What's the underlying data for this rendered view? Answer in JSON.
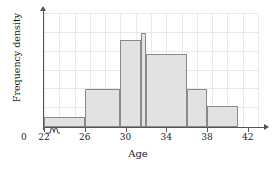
{
  "chart_data": {
    "type": "bar",
    "title": "",
    "subtitle": "",
    "xlabel": "Age",
    "ylabel": "Frequency density",
    "xlim": [
      22,
      43
    ],
    "ylim": [
      0,
      6
    ],
    "grid": true,
    "legend": null,
    "axis_break_x": true,
    "x_tick_labels": [
      "22",
      "26",
      "30",
      "34",
      "38",
      "42"
    ],
    "x_tick_values": [
      22,
      26,
      30,
      34,
      38,
      42
    ],
    "origin_label": "0",
    "y_tick_labels": [],
    "bins": [
      {
        "start": 22,
        "end": 26,
        "density": 0.55
      },
      {
        "start": 26,
        "end": 29.5,
        "density": 2.0
      },
      {
        "start": 29.5,
        "end": 31.5,
        "density": 4.6
      },
      {
        "start": 31.5,
        "end": 32,
        "density": 5.0
      },
      {
        "start": 32,
        "end": 36,
        "density": 3.9
      },
      {
        "start": 36,
        "end": 38,
        "density": 2.0
      },
      {
        "start": 38,
        "end": 41,
        "density": 1.1
      }
    ],
    "colors": {
      "bar_fill": "#e2e2e2",
      "bar_stroke": "#8a8a8a",
      "grid": "#e8e8e8",
      "axis": "#555555",
      "text": "#1a1a1a"
    }
  }
}
